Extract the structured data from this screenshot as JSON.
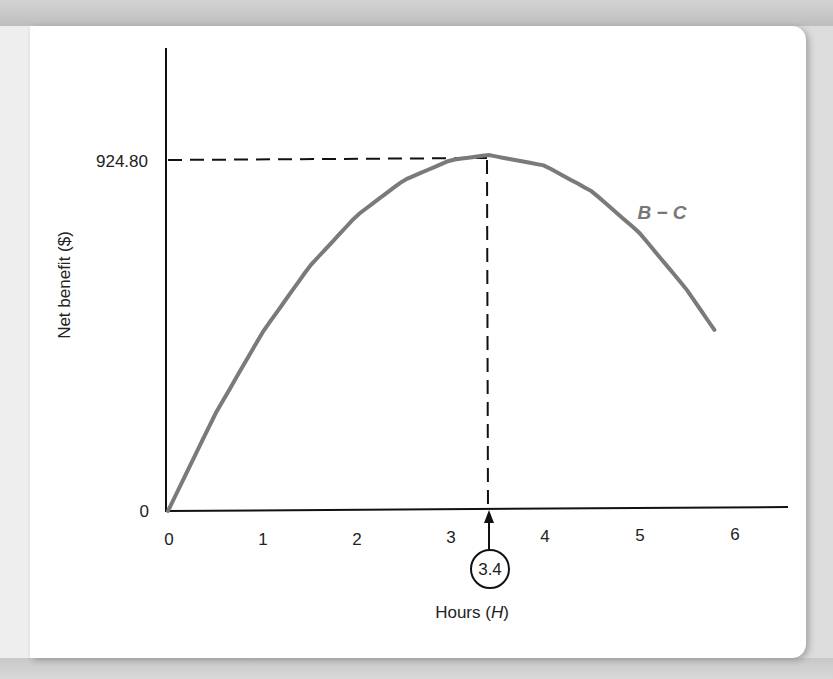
{
  "chart_data": {
    "type": "line",
    "title": "",
    "xlabel": "Hours (H)",
    "xlabel_parts": {
      "text": "Hours (",
      "var": "H",
      "close": ")"
    },
    "ylabel": "Net benefit ($)",
    "x_ticks": [
      "0",
      "1",
      "2",
      "3",
      "4",
      "5",
      "6"
    ],
    "y_ticks": [
      "0",
      "924.80"
    ],
    "xlim": [
      0,
      6.5
    ],
    "ylim": [
      0,
      1100
    ],
    "grid": false,
    "legend": "none",
    "series": [
      {
        "name": "B − C",
        "color": "#7a7a7a",
        "x": [
          0,
          0.5,
          1,
          1.5,
          2,
          2.5,
          3,
          3.4,
          4,
          4.5,
          5,
          5.5,
          5.8
        ],
        "y": [
          0,
          252,
          464,
          636,
          768,
          860,
          912,
          924.8,
          896,
          828,
          720,
          572,
          464
        ]
      }
    ],
    "annotations": [
      {
        "type": "dashed-guide",
        "from": [
          0,
          924.8
        ],
        "to": [
          3.4,
          924.8
        ]
      },
      {
        "type": "dashed-guide",
        "from": [
          3.4,
          924.8
        ],
        "to": [
          3.4,
          0
        ]
      },
      {
        "type": "circled-marker",
        "x": 3.4,
        "label": "3.4"
      },
      {
        "type": "curve-label",
        "text": "B − C"
      }
    ],
    "peak": {
      "x": 3.4,
      "y": 924.8
    }
  },
  "labels": {
    "y_axis_title": "Net benefit ($)",
    "x_axis_title_text": "Hours (",
    "x_axis_title_var": "H",
    "x_axis_title_close": ")",
    "y_tick_zero": "0",
    "y_tick_peak": "924.80",
    "x_ticks": [
      "0",
      "1",
      "2",
      "3",
      "4",
      "5",
      "6"
    ],
    "marker": "3.4",
    "curve_label": "B − C"
  },
  "colors": {
    "curve": "#7a7a7a",
    "axis": "#111111",
    "guide": "#111111"
  }
}
